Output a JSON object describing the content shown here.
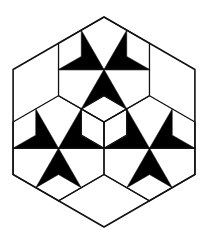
{
  "figure": {
    "width": 206,
    "height": 245,
    "background": "#ffffff",
    "stroke_color": "#111111",
    "fill_color": "#000000",
    "stroke_width": 1.3,
    "outer_hexagon": [
      [
        104,
        17
      ],
      [
        194.9,
        69.5
      ],
      [
        194.9,
        174.5
      ],
      [
        104,
        227
      ],
      [
        13.1,
        174.5
      ],
      [
        13.1,
        69.5
      ]
    ],
    "star_hexagons": [
      {
        "name": "top",
        "center": [
          104,
          69.5
        ]
      },
      {
        "name": "lower-left",
        "center": [
          58.5,
          148.25
        ]
      },
      {
        "name": "lower-right",
        "center": [
          149.5,
          148.25
        ]
      }
    ],
    "hex_radius": 52.5,
    "cube": {
      "center": [
        104,
        122
      ],
      "radius": 26.25
    },
    "extra_lines": [
      [
        [
          58.5,
          201
        ],
        [
          104,
          174.5
        ]
      ],
      [
        [
          104,
          174.5
        ],
        [
          149.5,
          201
        ]
      ]
    ]
  }
}
